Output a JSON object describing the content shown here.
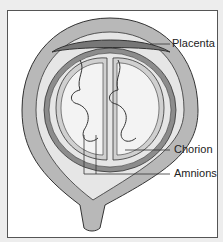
{
  "labels": {
    "placenta": "Placenta",
    "chorion": "Chorion",
    "amnions": "Amnions"
  },
  "colors": {
    "uterus_fill": "#b8b8b8",
    "chorion_fill": "#8c8c8c",
    "amnion_fill": "#d0d0d0",
    "sac_fill": "#ececec",
    "line": "#333333"
  }
}
